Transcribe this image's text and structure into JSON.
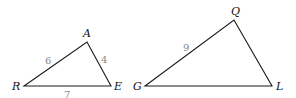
{
  "diagram": {
    "triangles": [
      {
        "name": "triangle-RAE",
        "vertices": {
          "R": [
            24,
            86
          ],
          "A": [
            87,
            42
          ],
          "E": [
            111,
            86
          ]
        },
        "vertex_labels": {
          "A": "A",
          "R": "R",
          "E": "E"
        },
        "side_labels": {
          "RA": "6",
          "AE": "4",
          "RE": "7"
        }
      },
      {
        "name": "triangle-GQL",
        "vertices": {
          "G": [
            145,
            86
          ],
          "Q": [
            234,
            20
          ],
          "L": [
            272,
            86
          ]
        },
        "vertex_labels": {
          "Q": "Q",
          "G": "G",
          "L": "L"
        },
        "side_labels": {
          "GQ": "9"
        }
      }
    ],
    "colors": {
      "stroke": "#1a1a1a",
      "vertex_text": "#111111",
      "side_text": "#888888"
    }
  }
}
